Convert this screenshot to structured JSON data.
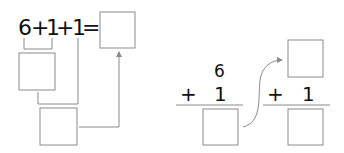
{
  "left_diagram": {
    "expression": {
      "term1": "6",
      "op1": "+",
      "term2": "1",
      "op2": "+",
      "term3": "1",
      "equals": "="
    },
    "boxes": [
      "partial-sum-box",
      "second-sum-box",
      "result-box"
    ]
  },
  "right_diagram": {
    "vertical1": {
      "top": "6",
      "operator": "+",
      "addend": "1"
    },
    "vertical2": {
      "operator": "+",
      "addend": "1"
    }
  },
  "colors": {
    "line": "#8a8a8a",
    "text": "#111111"
  }
}
